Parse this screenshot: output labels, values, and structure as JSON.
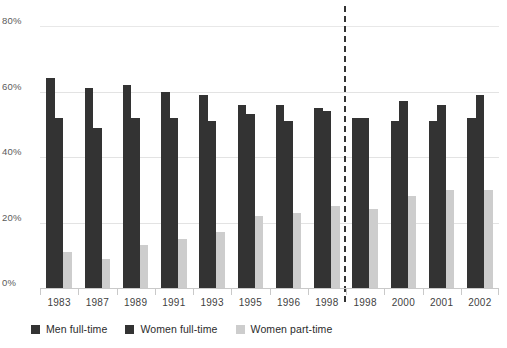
{
  "chart_data": {
    "type": "bar",
    "title": "",
    "subtitle": "",
    "xlabel": "",
    "ylabel": "",
    "ylim": [
      0,
      80
    ],
    "ytick_labels": [
      "0%",
      "20%",
      "40%",
      "60%",
      "80%"
    ],
    "ytick_values": [
      0,
      20,
      40,
      60,
      80
    ],
    "grid": true,
    "legend_position": "bottom-left",
    "categories": [
      "1983",
      "1987",
      "1989",
      "1991",
      "1993",
      "1995",
      "1996",
      "1998",
      "1998",
      "2000",
      "2001",
      "2002"
    ],
    "series": [
      {
        "name": "Men full-time",
        "color": "#333333",
        "values": [
          64,
          61,
          62,
          60,
          59,
          56,
          56,
          55,
          52,
          51,
          51,
          52
        ]
      },
      {
        "name": "Women full-time",
        "color": "#333333",
        "values": [
          52,
          49,
          52,
          52,
          51,
          53,
          51,
          54,
          52,
          57,
          56,
          59
        ]
      },
      {
        "name": "Women part-time",
        "color": "#cdcdcd",
        "values": [
          11,
          9,
          13,
          15,
          17,
          22,
          23,
          25,
          24,
          28,
          30,
          30
        ]
      }
    ],
    "annotations": [
      {
        "name": "series-break-divider",
        "type": "vertical-dashed-line",
        "after_category_index": 7,
        "color": "#333333"
      }
    ]
  },
  "legend": {
    "items": [
      {
        "label": "Men full-time",
        "color": "#333333",
        "swatch_icon": "square-swatch-icon"
      },
      {
        "label": "Women full-time",
        "color": "#333333",
        "swatch_icon": "square-swatch-icon"
      },
      {
        "label": "Women part-time",
        "color": "#cdcdcd",
        "swatch_icon": "square-swatch-icon"
      }
    ]
  },
  "colors": {
    "men_full_time": "#333333",
    "women_full_time": "#333333",
    "women_part_time": "#cdcdcd",
    "gridline": "#e3e3e3",
    "axis": "#c9c9c9",
    "text": "#3f3f3f",
    "background": "#ffffff"
  }
}
